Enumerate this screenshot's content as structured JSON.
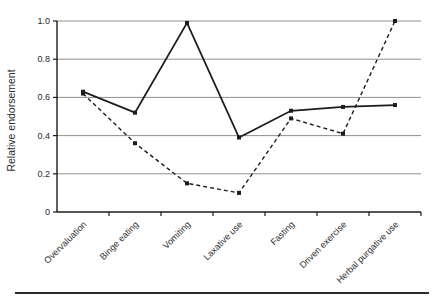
{
  "figure": {
    "ylabel": "Relative endorsement"
  },
  "chart_data": {
    "type": "line",
    "title": "",
    "xlabel": "",
    "ylabel": "Relative endorsement",
    "categories": [
      "Overvaluation",
      "Binge eating",
      "Vomiting",
      "Laxative use",
      "Fasting",
      "Driven exercise",
      "Herbal purgative use"
    ],
    "series": [
      {
        "name": "solid-line",
        "style": "solid",
        "values": [
          0.63,
          0.52,
          0.99,
          0.39,
          0.53,
          0.55,
          0.56
        ]
      },
      {
        "name": "dashed-line",
        "style": "dashed",
        "values": [
          0.62,
          0.36,
          0.15,
          0.1,
          0.49,
          0.41,
          1.0
        ]
      }
    ],
    "ylim": [
      0,
      1.0
    ],
    "yticks": [
      0,
      0.2,
      0.4,
      0.6,
      0.8,
      1.0
    ],
    "ytick_labels": [
      "0",
      "0.2",
      "0.4",
      "0.6",
      "0.8",
      "1.0"
    ],
    "grid": true,
    "legend": false,
    "colors": {
      "line": "#1c1c1c",
      "grid": "#8f8f8f",
      "axis": "#1c1c1c",
      "text": "#2b2b2b"
    }
  }
}
